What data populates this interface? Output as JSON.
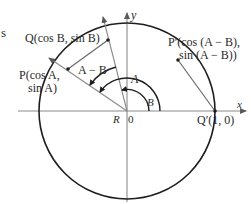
{
  "figure": {
    "type": "unit-circle angle-difference diagram",
    "colors": {
      "circle": "#1e1e1e",
      "axes": "#8a8a8a",
      "rays": "#8a8a8a",
      "chords": "#6a6a6a",
      "arcs": "#1e1e1e",
      "text": "#2a2a2a",
      "background": "#ffffff"
    }
  },
  "labels": {
    "cropped_text": "s",
    "Q": "Q(cos B, sin B)",
    "P_line1": "P(cos A,",
    "P_line2": "sin A)",
    "P_prime_line1": "P′(cos (A − B),",
    "P_prime_line2": "sin (A − B))",
    "Q_prime": "Q′(1, 0)",
    "angle_A": "A",
    "angle_B": "B",
    "angle_A_minus_B": "A − B",
    "x_axis": "x",
    "y_axis": "y",
    "origin": "0",
    "R": "R"
  },
  "points": {
    "origin": [
      0,
      0
    ],
    "Q_prime": [
      1,
      0
    ],
    "Q": [
      "cos B",
      "sin B"
    ],
    "P": [
      "cos A",
      "sin A"
    ],
    "P_prime": [
      "cos (A − B)",
      "sin (A − B)"
    ]
  }
}
